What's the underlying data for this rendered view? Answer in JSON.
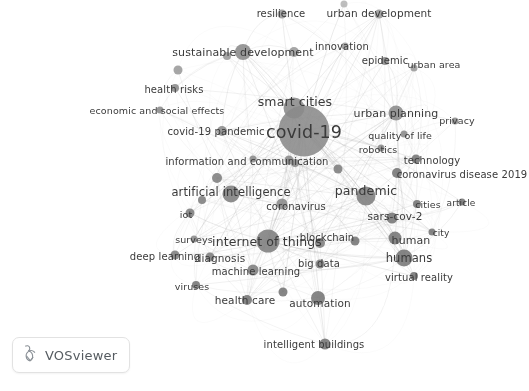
{
  "app": {
    "name": "VOSviewer",
    "badge_label": "VOSviewer",
    "background_color": "#ffffff",
    "node_color": "#8c8c8c",
    "node_color_dark": "#6e6e6e",
    "edge_color": "#9a9a9a",
    "label_color": "#3a3a3a"
  },
  "chart_data": {
    "type": "network",
    "title": "",
    "xlabel": "",
    "ylabel": "",
    "grid": false,
    "legend": false,
    "nodes": [
      {
        "label": "covid-19",
        "x": 304,
        "y": 131,
        "r": 25.5,
        "font": 17.5,
        "lx": 304,
        "ly": 132,
        "weight": 100,
        "shade": "#8a8a8a"
      },
      {
        "label": "smart cities",
        "x": 294,
        "y": 108,
        "r": 10.5,
        "font": 12.5,
        "lx": 295,
        "ly": 101,
        "weight": 62,
        "shade": "#8a8a8a"
      },
      {
        "label": "internet of things",
        "x": 268,
        "y": 241,
        "r": 11.5,
        "font": 12.5,
        "lx": 267,
        "ly": 241,
        "weight": 60,
        "shade": "#7e7e7e"
      },
      {
        "label": "pandemic",
        "x": 366,
        "y": 196,
        "r": 9.5,
        "font": 12.5,
        "lx": 366,
        "ly": 190,
        "weight": 55,
        "shade": "#7e7e7e"
      },
      {
        "label": "artificial intelligence",
        "x": 231,
        "y": 194,
        "r": 8.5,
        "font": 11.5,
        "lx": 231,
        "ly": 192,
        "weight": 48,
        "shade": "#7e7e7e"
      },
      {
        "label": "urban planning",
        "x": 396,
        "y": 113,
        "r": 7.5,
        "font": 11,
        "lx": 396,
        "ly": 113,
        "weight": 42,
        "shade": "#8a8a8a"
      },
      {
        "label": "sustainable development",
        "x": 243,
        "y": 52,
        "r": 8,
        "font": 11,
        "lx": 243,
        "ly": 52,
        "weight": 44,
        "shade": "#8a8a8a"
      },
      {
        "label": "humans",
        "x": 404,
        "y": 258,
        "r": 8.5,
        "font": 11.5,
        "lx": 409,
        "ly": 258,
        "weight": 45,
        "shade": "#757575"
      },
      {
        "label": "human",
        "x": 395,
        "y": 238,
        "r": 6.5,
        "font": 11,
        "lx": 411,
        "ly": 240,
        "weight": 36,
        "shade": "#757575"
      },
      {
        "label": "coronavirus",
        "x": 282,
        "y": 204,
        "r": 5.5,
        "font": 10,
        "lx": 296,
        "ly": 206,
        "weight": 30,
        "shade": "#8a8a8a"
      },
      {
        "label": "covid-19 pandemic",
        "x": 222,
        "y": 131,
        "r": 5,
        "font": 10,
        "lx": 216,
        "ly": 131,
        "weight": 29,
        "shade": "#8a8a8a"
      },
      {
        "label": "information and communication",
        "x": 289,
        "y": 160,
        "r": 4.5,
        "font": 10,
        "lx": 247,
        "ly": 161,
        "weight": 27,
        "shade": "#8a8a8a"
      },
      {
        "label": "machine learning",
        "x": 253,
        "y": 270,
        "r": 5.5,
        "font": 10,
        "lx": 256,
        "ly": 271,
        "weight": 30,
        "shade": "#7e7e7e"
      },
      {
        "label": "automation",
        "x": 318,
        "y": 298,
        "r": 7,
        "font": 10.5,
        "lx": 320,
        "ly": 303,
        "weight": 34,
        "shade": "#757575"
      },
      {
        "label": "blockchain",
        "x": 320,
        "y": 243,
        "r": 5,
        "font": 10,
        "lx": 327,
        "ly": 237,
        "weight": 28,
        "shade": "#7e7e7e"
      },
      {
        "label": "big data",
        "x": 320,
        "y": 264,
        "r": 4.5,
        "font": 10,
        "lx": 319,
        "ly": 263,
        "weight": 26,
        "shade": "#7e7e7e"
      },
      {
        "label": "sars-cov-2",
        "x": 392,
        "y": 218,
        "r": 5.5,
        "font": 10.5,
        "lx": 395,
        "ly": 216,
        "weight": 31,
        "shade": "#757575"
      },
      {
        "label": "health care",
        "x": 247,
        "y": 300,
        "r": 5,
        "font": 10.5,
        "lx": 245,
        "ly": 300,
        "weight": 29,
        "shade": "#757575"
      },
      {
        "label": "diagnosis",
        "x": 210,
        "y": 257,
        "r": 4.5,
        "font": 10.5,
        "lx": 220,
        "ly": 258,
        "weight": 27,
        "shade": "#7e7e7e"
      },
      {
        "label": "deep learning",
        "x": 175,
        "y": 255,
        "r": 4.5,
        "font": 10,
        "lx": 165,
        "ly": 256,
        "weight": 26,
        "shade": "#7e7e7e"
      },
      {
        "label": "surveys",
        "x": 194,
        "y": 239,
        "r": 3.5,
        "font": 9.5,
        "lx": 194,
        "ly": 239,
        "weight": 22,
        "shade": "#8a8a8a"
      },
      {
        "label": "iot",
        "x": 190,
        "y": 213,
        "r": 4.5,
        "font": 9.5,
        "lx": 186,
        "ly": 214,
        "weight": 25,
        "shade": "#7e7e7e"
      },
      {
        "label": "viruses",
        "x": 196,
        "y": 285,
        "r": 4,
        "font": 9.5,
        "lx": 192,
        "ly": 286,
        "weight": 23,
        "shade": "#757575"
      },
      {
        "label": "intelligent buildings",
        "x": 325,
        "y": 344,
        "r": 5.5,
        "font": 10,
        "lx": 314,
        "ly": 344,
        "weight": 29,
        "shade": "#757575"
      },
      {
        "label": "virtual reality",
        "x": 414,
        "y": 276,
        "r": 4,
        "font": 10,
        "lx": 419,
        "ly": 277,
        "weight": 24,
        "shade": "#757575"
      },
      {
        "label": "cities",
        "x": 417,
        "y": 204,
        "r": 4,
        "font": 9.5,
        "lx": 428,
        "ly": 204,
        "weight": 24,
        "shade": "#757575"
      },
      {
        "label": "city",
        "x": 432,
        "y": 232,
        "r": 3.5,
        "font": 9,
        "lx": 441,
        "ly": 233,
        "weight": 21,
        "shade": "#757575"
      },
      {
        "label": "article",
        "x": 462,
        "y": 202,
        "r": 3.5,
        "font": 9,
        "lx": 461,
        "ly": 203,
        "weight": 21,
        "shade": "#757575"
      },
      {
        "label": "technology",
        "x": 416,
        "y": 159,
        "r": 4.5,
        "font": 10,
        "lx": 432,
        "ly": 160,
        "weight": 26,
        "shade": "#757575"
      },
      {
        "label": "coronavirus disease 2019",
        "x": 397,
        "y": 173,
        "r": 5,
        "font": 10,
        "lx": 462,
        "ly": 174,
        "weight": 28,
        "shade": "#757575"
      },
      {
        "label": "quality of life",
        "x": 404,
        "y": 134,
        "r": 3.5,
        "font": 9.5,
        "lx": 400,
        "ly": 135,
        "weight": 21,
        "shade": "#8a8a8a"
      },
      {
        "label": "robotics",
        "x": 381,
        "y": 148,
        "r": 3.5,
        "font": 9.5,
        "lx": 378,
        "ly": 149,
        "weight": 21,
        "shade": "#8a8a8a"
      },
      {
        "label": "privacy",
        "x": 455,
        "y": 121,
        "r": 3.5,
        "font": 9.5,
        "lx": 457,
        "ly": 120,
        "weight": 21,
        "shade": "#8a8a8a"
      },
      {
        "label": "epidemic",
        "x": 385,
        "y": 61,
        "r": 4,
        "font": 10,
        "lx": 385,
        "ly": 60,
        "weight": 23,
        "shade": "#8a8a8a"
      },
      {
        "label": "urban area",
        "x": 414,
        "y": 68,
        "r": 3.5,
        "font": 9.5,
        "lx": 434,
        "ly": 64,
        "weight": 21,
        "shade": "#9a9a9a"
      },
      {
        "label": "innovation",
        "x": 345,
        "y": 46,
        "r": 3.5,
        "font": 10,
        "lx": 342,
        "ly": 46,
        "weight": 22,
        "shade": "#9a9a9a"
      },
      {
        "label": "urban development",
        "x": 379,
        "y": 14,
        "r": 4.5,
        "font": 10.5,
        "lx": 379,
        "ly": 13,
        "weight": 25,
        "shade": "#9a9a9a"
      },
      {
        "label": "resilience",
        "x": 282,
        "y": 14,
        "r": 4.5,
        "font": 10,
        "lx": 281,
        "ly": 13,
        "weight": 25,
        "shade": "#9a9a9a"
      },
      {
        "label": "health risks",
        "x": 175,
        "y": 88,
        "r": 4,
        "font": 10,
        "lx": 174,
        "ly": 89,
        "weight": 23,
        "shade": "#8a8a8a"
      },
      {
        "label": "economic and social effects",
        "x": 160,
        "y": 110,
        "r": 3.5,
        "font": 9.5,
        "lx": 157,
        "ly": 110,
        "weight": 21,
        "shade": "#8a8a8a"
      },
      {
        "label": "",
        "x": 295,
        "y": 163,
        "r": 4,
        "font": 0,
        "lx": 0,
        "ly": 0,
        "weight": 20,
        "shade": "#8a8a8a"
      },
      {
        "label": "",
        "x": 178,
        "y": 70,
        "r": 4.5,
        "font": 0,
        "lx": 0,
        "ly": 0,
        "weight": 20,
        "shade": "#9a9a9a"
      },
      {
        "label": "",
        "x": 294,
        "y": 52,
        "r": 5,
        "font": 0,
        "lx": 0,
        "ly": 0,
        "weight": 20,
        "shade": "#9a9a9a"
      },
      {
        "label": "",
        "x": 344,
        "y": 4,
        "r": 3.5,
        "font": 0,
        "lx": 0,
        "ly": 0,
        "weight": 18,
        "shade": "#b4b4b4"
      },
      {
        "label": "",
        "x": 217,
        "y": 178,
        "r": 5,
        "font": 0,
        "lx": 0,
        "ly": 0,
        "weight": 22,
        "shade": "#7e7e7e"
      },
      {
        "label": "",
        "x": 202,
        "y": 200,
        "r": 4,
        "font": 0,
        "lx": 0,
        "ly": 0,
        "weight": 20,
        "shade": "#7e7e7e"
      },
      {
        "label": "",
        "x": 338,
        "y": 169,
        "r": 4.5,
        "font": 0,
        "lx": 0,
        "ly": 0,
        "weight": 21,
        "shade": "#7e7e7e"
      },
      {
        "label": "",
        "x": 355,
        "y": 241,
        "r": 4.5,
        "font": 0,
        "lx": 0,
        "ly": 0,
        "weight": 21,
        "shade": "#757575"
      },
      {
        "label": "",
        "x": 283,
        "y": 292,
        "r": 4.5,
        "font": 0,
        "lx": 0,
        "ly": 0,
        "weight": 21,
        "shade": "#757575"
      },
      {
        "label": "",
        "x": 253,
        "y": 159,
        "r": 3.5,
        "font": 0,
        "lx": 0,
        "ly": 0,
        "weight": 18,
        "shade": "#8a8a8a"
      },
      {
        "label": "",
        "x": 227,
        "y": 56,
        "r": 4,
        "font": 0,
        "lx": 0,
        "ly": 0,
        "weight": 19,
        "shade": "#9a9a9a"
      }
    ],
    "edges_note": "dense grey curved co-occurrence links between all nodes",
    "cluster_count": 1
  }
}
